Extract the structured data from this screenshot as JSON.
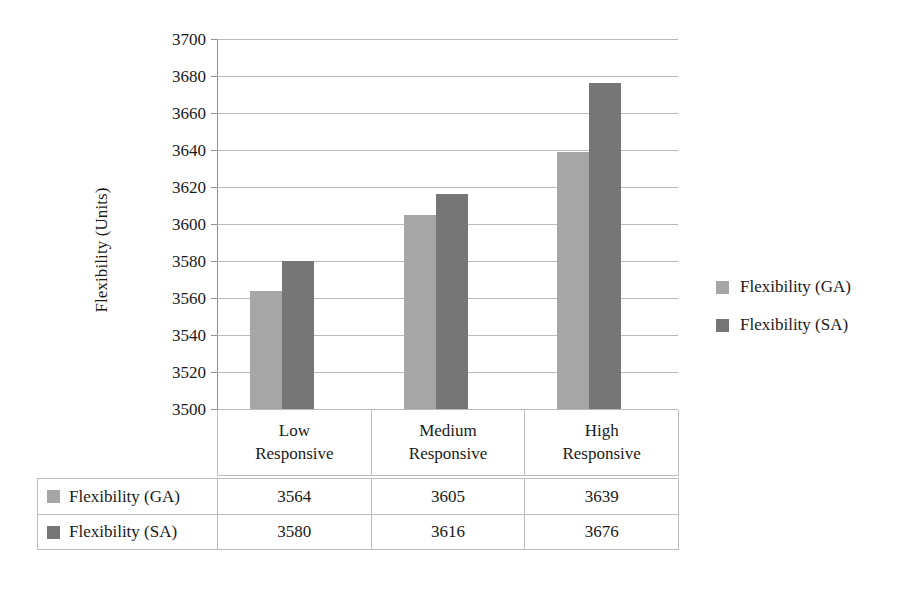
{
  "chart_data": {
    "type": "bar",
    "title": "",
    "xlabel": "",
    "ylabel": "Flexibility (Units)",
    "categories": [
      "Low Responsive",
      "Medium Responsive",
      "High Responsive"
    ],
    "category_lines": [
      [
        "Low",
        "Responsive"
      ],
      [
        "Medium",
        "Responsive"
      ],
      [
        "High",
        "Responsive"
      ]
    ],
    "series": [
      {
        "name": "Flexibility (GA)",
        "values": [
          3564,
          3605,
          3639
        ],
        "color": "#a6a6a6"
      },
      {
        "name": "Flexibility (SA)",
        "values": [
          3580,
          3616,
          3676
        ],
        "color": "#767676"
      }
    ],
    "ylim": [
      3500,
      3700
    ],
    "ytick_step": 20,
    "yticks": [
      3700,
      3680,
      3660,
      3640,
      3620,
      3600,
      3580,
      3560,
      3540,
      3520,
      3500
    ],
    "ytick_labels": [
      "3700",
      "3680",
      "3660",
      "3640",
      "3620",
      "3600",
      "3580",
      "3560",
      "3540",
      "3520",
      "3500"
    ],
    "grid": true,
    "legend_position": "right",
    "data_table_visible": true
  },
  "legend": {
    "items": [
      {
        "label": "Flexibility (GA)",
        "color": "#a6a6a6"
      },
      {
        "label": "Flexibility (SA)",
        "color": "#767676"
      }
    ]
  },
  "data_table": {
    "rows": [
      {
        "label": "Flexibility (GA)",
        "color": "#a6a6a6",
        "values": [
          "3564",
          "3605",
          "3639"
        ]
      },
      {
        "label": "Flexibility (SA)",
        "color": "#767676",
        "values": [
          "3580",
          "3616",
          "3676"
        ]
      }
    ]
  },
  "colors": {
    "series_ga": "#a6a6a6",
    "series_sa": "#767676",
    "gridline": "#b9b9b9",
    "axis": "#8f8f8f",
    "border": "#bdbdbd",
    "text": "#1a1a1a",
    "background": "#ffffff"
  }
}
